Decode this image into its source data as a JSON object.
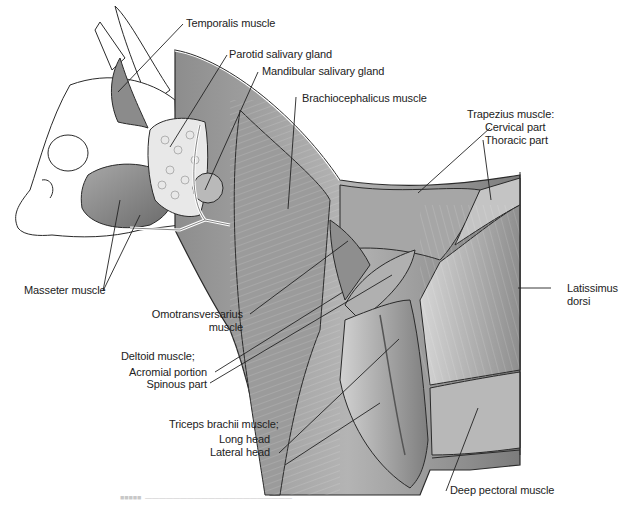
{
  "figure": {
    "labels": {
      "temporalis": "Temporalis muscle",
      "parotid": "Parotid salivary gland",
      "mandibular": "Mandibular salivary gland",
      "brachiocephalicus": "Brachiocephalicus muscle",
      "trapezius_title": "Trapezius muscle:",
      "trapezius_cervical": "Cervical part",
      "trapezius_thoracic": "Thoracic part",
      "latissimus_1": "Latissimus",
      "latissimus_2": "dorsi",
      "masseter": "Masseter muscle",
      "omotransversarius_1": "Omotransversarius",
      "omotransversarius_2": "muscle",
      "deltoid_title": "Deltoid muscle;",
      "deltoid_acromial": "Acromial portion",
      "deltoid_spinous": "Spinous part",
      "triceps_title": "Triceps brachii muscle;",
      "triceps_long": "Long head",
      "triceps_lateral": "Lateral head",
      "deep_pectoral": "Deep pectoral muscle"
    },
    "caption": "FIGURE (faded, illegible caption text)"
  },
  "colors": {
    "outline": "#2a2a2a",
    "muscle_dark": "#6f6f6f",
    "muscle_mid": "#9a9a9a",
    "muscle_light": "#cfcfcf",
    "gland": "#e6e6e6",
    "text": "#222222"
  }
}
